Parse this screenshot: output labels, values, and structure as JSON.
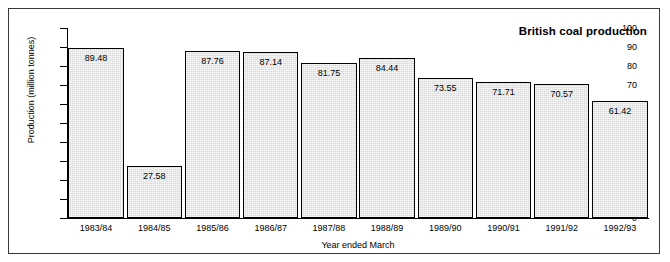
{
  "chart_data": {
    "type": "bar",
    "title": "British coal production",
    "xlabel": "Year ended March",
    "ylabel": "Production (million tonnes)",
    "categories": [
      "1983/84",
      "1984/85",
      "1985/86",
      "1986/87",
      "1987/88",
      "1988/89",
      "1989/90",
      "1990/91",
      "1991/92",
      "1992/93"
    ],
    "values": [
      89.48,
      27.58,
      87.76,
      87.14,
      81.75,
      84.44,
      73.55,
      71.71,
      70.57,
      61.42
    ],
    "value_labels": [
      "89.48",
      "27.58",
      "87.76",
      "87.14",
      "81.75",
      "84.44",
      "73.55",
      "71.71",
      "70.57",
      "61.42"
    ],
    "ylim": [
      0,
      100
    ],
    "ytick_values": [
      0,
      10,
      20,
      30,
      40,
      50,
      60,
      70,
      80,
      90,
      100
    ],
    "ytick_labels": [
      "0",
      "10",
      "20",
      "30",
      "40",
      "50",
      "60",
      "70",
      "80",
      "90",
      "100"
    ],
    "grid": false,
    "legend": "none",
    "bar_fill_color": "#d9d9d9",
    "bar_edge_color": "#000000",
    "axis_color": "#000000",
    "frame_color": "#3a3a3a",
    "background_color": "#ffffff"
  }
}
